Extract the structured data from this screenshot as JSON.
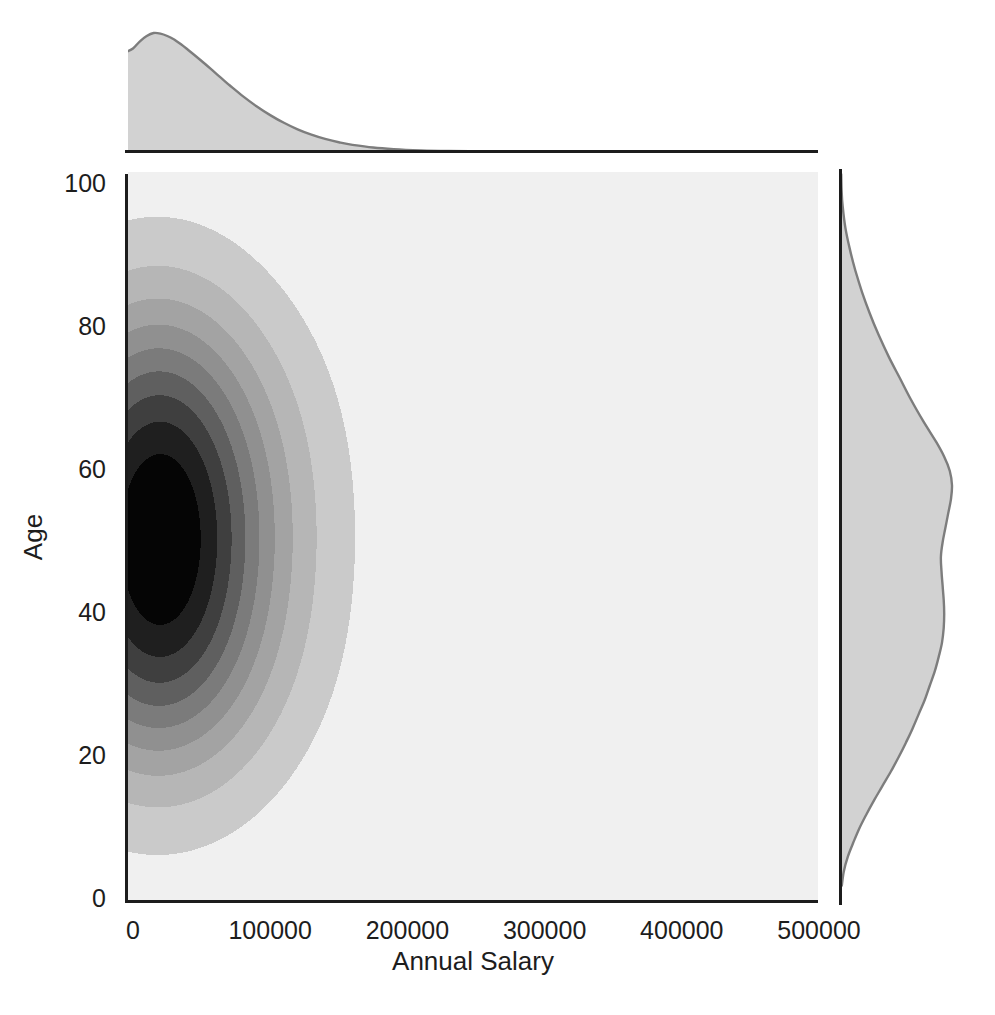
{
  "chart_data": {
    "type": "kde_joint",
    "title": "",
    "xlabel": "Annual Salary",
    "ylabel": "Age",
    "xlim": [
      0,
      500000
    ],
    "ylim": [
      0,
      100
    ],
    "grid": false,
    "legend": null,
    "x_ticks": [
      0,
      100000,
      200000,
      300000,
      400000,
      500000
    ],
    "x_tick_labels": [
      "0",
      "100000",
      "200000",
      "300000",
      "400000",
      "500000"
    ],
    "y_ticks": [
      0,
      20,
      40,
      60,
      80,
      100
    ],
    "y_tick_labels": [
      "0",
      "20",
      "40",
      "60",
      "80",
      "100"
    ],
    "styles": {
      "figure_bg": "#ffffff",
      "axes_bg": "#f0f0f0",
      "spine_color": "#1c1c1c",
      "text_color": "#1d1d1d",
      "marginal_fill": "#d2d2d2",
      "marginal_stroke": "#7d7d7d"
    },
    "joint_kde": {
      "description": "Filled grayscale 2D KDE of Annual Salary (x) vs Age (y). Density hugs the left axis: concentrated at salaries 0-70000 across ages ~30-70 (near-black core), fading outward to ~170000 salary and ages ~7-95 at the lightest contour.",
      "peak": {
        "salary": 20000,
        "age": 51
      },
      "levels": [
        0.05,
        0.145,
        0.25,
        0.355,
        0.46,
        0.565,
        0.67,
        0.775,
        0.88
      ],
      "band_colors": [
        "#cacaca",
        "#b6b6b6",
        "#a3a3a3",
        "#909090",
        "#7b7b7b",
        "#5f5f5f",
        "#3f3f3f",
        "#1f1f1f",
        "#050505"
      ],
      "kernels": [
        {
          "mx": 20000,
          "my": 36,
          "sx": 58000,
          "sy": 12.5,
          "w": 1.0
        },
        {
          "mx": 20000,
          "my": 46,
          "sx": 58000,
          "sy": 12.5,
          "w": 1.0
        },
        {
          "mx": 20000,
          "my": 56,
          "sx": 58000,
          "sy": 12.5,
          "w": 1.0
        },
        {
          "mx": 20000,
          "my": 66,
          "sx": 58000,
          "sy": 12.5,
          "w": 1.0
        },
        {
          "mx": 16000,
          "my": 27,
          "sx": 48000,
          "sy": 11,
          "w": 0.45
        },
        {
          "mx": 16000,
          "my": 76,
          "sx": 45000,
          "sy": 11,
          "w": 0.38
        }
      ]
    },
    "marginal_salary_kde": {
      "description": "Top marginal density of Annual Salary: peak near 15000, long right tail fading out by ~250000.",
      "points": [
        [
          -4000,
          0.845
        ],
        [
          0,
          0.87
        ],
        [
          5000,
          0.93
        ],
        [
          10000,
          0.975
        ],
        [
          15000,
          1.0
        ],
        [
          20000,
          0.995
        ],
        [
          25000,
          0.975
        ],
        [
          30000,
          0.945
        ],
        [
          35000,
          0.905
        ],
        [
          40000,
          0.86
        ],
        [
          50000,
          0.765
        ],
        [
          60000,
          0.665
        ],
        [
          70000,
          0.565
        ],
        [
          80000,
          0.47
        ],
        [
          90000,
          0.385
        ],
        [
          100000,
          0.31
        ],
        [
          110000,
          0.245
        ],
        [
          120000,
          0.19
        ],
        [
          130000,
          0.145
        ],
        [
          140000,
          0.11
        ],
        [
          150000,
          0.082
        ],
        [
          160000,
          0.06
        ],
        [
          175000,
          0.038
        ],
        [
          190000,
          0.024
        ],
        [
          210000,
          0.013
        ],
        [
          230000,
          0.008
        ],
        [
          260000,
          0.005
        ],
        [
          300000,
          0.004
        ],
        [
          350000,
          0.003
        ],
        [
          400000,
          0.0025
        ],
        [
          450000,
          0.002
        ],
        [
          500000,
          0.002
        ]
      ]
    },
    "marginal_age_kde": {
      "description": "Right marginal density of Age: main peak near 58-60, shallow dip near 48, secondary shoulder near 38-42, tapering to ~0 at ages 3 and 100.",
      "points": [
        [
          101.5,
          0.002
        ],
        [
          99,
          0.006
        ],
        [
          97,
          0.015
        ],
        [
          94,
          0.04
        ],
        [
          91,
          0.08
        ],
        [
          88,
          0.13
        ],
        [
          85,
          0.19
        ],
        [
          82,
          0.26
        ],
        [
          79,
          0.34
        ],
        [
          76,
          0.43
        ],
        [
          73,
          0.53
        ],
        [
          70,
          0.63
        ],
        [
          67,
          0.74
        ],
        [
          64,
          0.86
        ],
        [
          62,
          0.93
        ],
        [
          60,
          0.98
        ],
        [
          58,
          1.0
        ],
        [
          56,
          0.99
        ],
        [
          54,
          0.965
        ],
        [
          52,
          0.94
        ],
        [
          50,
          0.915
        ],
        [
          48,
          0.9
        ],
        [
          46,
          0.905
        ],
        [
          44,
          0.915
        ],
        [
          42,
          0.925
        ],
        [
          40,
          0.93
        ],
        [
          38,
          0.925
        ],
        [
          36,
          0.91
        ],
        [
          34,
          0.88
        ],
        [
          32,
          0.845
        ],
        [
          30,
          0.8
        ],
        [
          28,
          0.755
        ],
        [
          26,
          0.7
        ],
        [
          24,
          0.645
        ],
        [
          22,
          0.585
        ],
        [
          20,
          0.52
        ],
        [
          18,
          0.45
        ],
        [
          16,
          0.375
        ],
        [
          14,
          0.3
        ],
        [
          12,
          0.23
        ],
        [
          10,
          0.165
        ],
        [
          8,
          0.11
        ],
        [
          6,
          0.06
        ],
        [
          4,
          0.025
        ],
        [
          2,
          0.007
        ]
      ]
    }
  }
}
